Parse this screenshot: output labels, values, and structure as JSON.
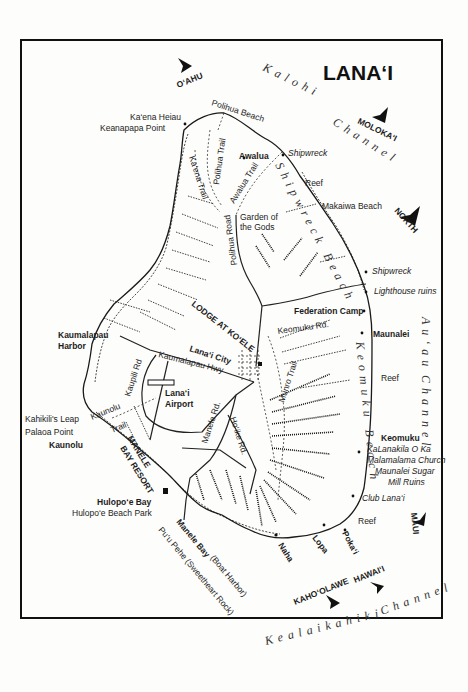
{
  "map": {
    "title": "LANA‘I",
    "compass": {
      "label": "NORTH"
    },
    "neighbor_islands": [
      {
        "name": "O‘AHU"
      },
      {
        "name": "MOLOKA‘I"
      },
      {
        "name": "MAUI"
      },
      {
        "name": "KAHO‘OLAWE"
      },
      {
        "name": "HAWAI‘I"
      }
    ],
    "channels": [
      {
        "name": "Kalohi",
        "second": "Channel"
      },
      {
        "name": "Au‘au",
        "second": "Channel"
      },
      {
        "name": "Kealaikahiki",
        "second": "Channel"
      }
    ],
    "places": {
      "kaena_heiau": "Ka‘ena Heiau",
      "keanapapa_point": "Keanapapa Point",
      "polihua_beach": "Polihua Beach",
      "awalua": "Awalua",
      "shipwreck_north": "Shipwreck",
      "reef_north": "Reef",
      "makaiwa_beach": "Makaiwa Beach",
      "garden_of_the_gods_1": "Garden of",
      "garden_of_the_gods_2": "the Gods",
      "shipwreck_beach": "Shipwreck Beach",
      "shipwreck_east": "Shipwreck",
      "lighthouse_ruins": "Lighthouse ruins",
      "federation_camp": "Federation Camp",
      "maunalei": "Maunalei",
      "reef_east": "Reef",
      "keomuku": "Keomuku",
      "kalanakila_1": "KaLanakila O Ka",
      "kalanakila_2": "Malamalama Church",
      "maunalei_sugar_1": "Maunalei Sugar",
      "maunalei_sugar_2": "Mill Ruins",
      "club_lanai": "Club Lana‘i",
      "reef_south": "Reef",
      "pokai": "Poka‘i",
      "lopa": "Lopa",
      "naha": "Naha",
      "manele_bay": "Manele Bay",
      "boat_harbor": "(Boat Harbor)",
      "puu_pehe": "Pu‘u Pehe (Sweetheart Rock)",
      "hulopoe_bay": "Hulopo‘e Bay",
      "hulopoe_beach_park": "Hulopo‘e Beach Park",
      "manele_bay_resort_1": "MANELE",
      "manele_bay_resort_2": "BAY RESORT",
      "kaunolu": "Kaunolu",
      "palaoa_point": "Palaoa Point",
      "kahikilis_leap": "Kahikili's Leap",
      "kaumalapau_harbor_1": "Kaumalapau",
      "kaumalapau_harbor_2": "Harbor",
      "lanai_airport_1": "Lana‘i",
      "lanai_airport_2": "Airport",
      "lanai_city": "Lana‘i City",
      "lodge_at_koele": "LODGE AT KO‘ELE",
      "keomuku_beach": "Keomuku Beach"
    },
    "roads": {
      "polihua_trail": "Polihua Trail",
      "kaena_trail": "Ka‘ena Trail",
      "awalua_trail": "Awalua Trail",
      "polihua_road": "Polihua Road",
      "keomuku_rd": "Keomuku Rd.",
      "kaumalapau_hwy": "Kaumalapau Hwy",
      "kaupili_rd": "Kaupili Rd",
      "kaunolu_trail_1": "Kaunolu",
      "kaunolu_trail_2": "Trail",
      "manele_rd": "Manele Rd.",
      "hoike_rd": "Ho‘ike Rd.",
      "munro_trail": "Munro Trail"
    }
  }
}
